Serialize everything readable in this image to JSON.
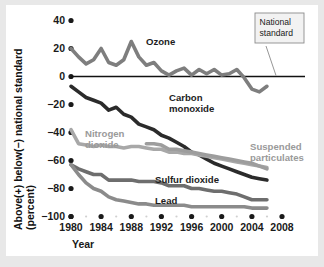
{
  "chart_data": {
    "type": "line",
    "title": "",
    "xlabel": "Year",
    "ylabel": "Above(+) below(−) national standard (percent)",
    "xlim": [
      1980,
      2008
    ],
    "ylim": [
      -100,
      40
    ],
    "xticks": [
      "1980",
      "1984",
      "1988",
      "1992",
      "1996",
      "2000",
      "2004",
      "2008"
    ],
    "yticks": [
      "40",
      "20",
      "0",
      "−20",
      "−40",
      "−60",
      "−80",
      "−100"
    ],
    "grid": false,
    "legend": "inline-labels",
    "annotations": [
      {
        "text": "National standard",
        "points_to": "zero-line",
        "value": 0
      }
    ],
    "series": [
      {
        "name": "Ozone",
        "color": "#7e7e7e",
        "label_x": 1990,
        "label_y": 19,
        "label_align": "dark",
        "x": [
          1980,
          1981,
          1982,
          1983,
          1984,
          1985,
          1986,
          1987,
          1988,
          1989,
          1990,
          1991,
          1992,
          1993,
          1994,
          1995,
          1996,
          1997,
          1998,
          1999,
          2000,
          2001,
          2002,
          2003,
          2004,
          2005,
          2006
        ],
        "y": [
          20,
          14,
          9,
          12,
          20,
          10,
          8,
          12,
          25,
          14,
          8,
          10,
          4,
          1,
          4,
          6,
          1,
          5,
          2,
          5,
          1,
          2,
          5,
          -1,
          -9,
          -11,
          -7
        ]
      },
      {
        "name": "Carbon monoxide",
        "color": "#2b2b2b",
        "label_x": 1993,
        "label_y": -26,
        "label_align": "dark",
        "x": [
          1980,
          1981,
          1982,
          1983,
          1984,
          1985,
          1986,
          1987,
          1988,
          1989,
          1990,
          1991,
          1992,
          1993,
          1994,
          1995,
          1996,
          1997,
          1998,
          1999,
          2000,
          2001,
          2002,
          2003,
          2004,
          2005,
          2006
        ],
        "y": [
          -7,
          -11,
          -15,
          -17,
          -19,
          -24,
          -22,
          -27,
          -29,
          -34,
          -36,
          -38,
          -42,
          -44,
          -47,
          -50,
          -54,
          -56,
          -59,
          -62,
          -64,
          -66,
          -68,
          -70,
          -72,
          -73,
          -74
        ]
      },
      {
        "name": "Nitrogen dioxide",
        "color": "#a8a8a8",
        "label_x": 1983,
        "label_y": -40,
        "label_align": "light",
        "x": [
          1980,
          1981,
          1982,
          1983,
          1984,
          1985,
          1986,
          1987,
          1988,
          1989,
          1990,
          1991,
          1992,
          1993,
          1994,
          1995,
          1996,
          1997,
          1998,
          1999,
          2000,
          2001,
          2002,
          2003,
          2004,
          2005,
          2006
        ],
        "y": [
          -38,
          -48,
          -49,
          -50,
          -49,
          -50,
          -50,
          -51,
          -50,
          -50,
          -51,
          -52,
          -52,
          -54,
          -54,
          -55,
          -55,
          -56,
          -57,
          -58,
          -59,
          -60,
          -61,
          -62,
          -63,
          -64,
          -65
        ]
      },
      {
        "name": "Suspended particulates",
        "color": "#9d9d9d",
        "label_x": 2002,
        "label_y": -50,
        "label_align": "light",
        "x": [
          1990,
          1991,
          1992,
          1993,
          1994,
          1995,
          1996,
          1997,
          1998,
          1999,
          2000,
          2001,
          2002,
          2003,
          2004,
          2005,
          2006
        ],
        "y": [
          -48,
          -48,
          -49,
          -52,
          -52,
          -53,
          -54,
          -55,
          -56,
          -57,
          -58,
          -59,
          -60,
          -61,
          -62,
          -64,
          -66
        ]
      },
      {
        "name": "Sulfur dioxide",
        "color": "#6e6e6e",
        "label_x": 1994,
        "label_y": -74,
        "label_align": "dark",
        "x": [
          1980,
          1981,
          1982,
          1983,
          1984,
          1985,
          1986,
          1987,
          1988,
          1989,
          1990,
          1991,
          1992,
          1993,
          1994,
          1995,
          1996,
          1997,
          1998,
          1999,
          2000,
          2001,
          2002,
          2003,
          2004,
          2005,
          2006
        ],
        "y": [
          -63,
          -66,
          -68,
          -70,
          -70,
          -74,
          -74,
          -74,
          -74,
          -75,
          -75,
          -75,
          -76,
          -78,
          -78,
          -78,
          -80,
          -80,
          -81,
          -82,
          -82,
          -83,
          -84,
          -86,
          -88,
          -88,
          -88
        ]
      },
      {
        "name": "Lead",
        "color": "#8b8b8b",
        "label_x": 1994,
        "label_y": -83,
        "label_align": "dark",
        "x": [
          1980,
          1981,
          1982,
          1983,
          1984,
          1985,
          1986,
          1987,
          1988,
          1989,
          1990,
          1991,
          1992,
          1993,
          1994,
          1995,
          1996,
          1997,
          1998,
          1999,
          2000,
          2001,
          2002,
          2003,
          2004,
          2005,
          2006
        ],
        "y": [
          -63,
          -70,
          -76,
          -80,
          -82,
          -86,
          -88,
          -89,
          -90,
          -91,
          -91,
          -92,
          -92,
          -92,
          -92,
          -92,
          -93,
          -93,
          -93,
          -93,
          -93,
          -93,
          -93,
          -93,
          -94,
          -94,
          -94
        ]
      }
    ]
  },
  "axis": {
    "y_title": "Above(+) below(−) national standard (percent)",
    "y_title_line1": "Above(+) below(−) national standard",
    "y_title_line2": "(percent)",
    "x_title": "Year"
  },
  "callout": {
    "line1": "National",
    "line2": "standard"
  }
}
